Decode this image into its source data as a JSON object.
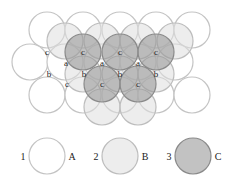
{
  "colors": {
    "A": {
      "fill": "#ffffff",
      "stroke": "#c4c4c4"
    },
    "B": {
      "fill": "#dedede",
      "fillOpacity": 0.55,
      "stroke": "#bdbdbd"
    },
    "C": {
      "fill": "#9a9a9a",
      "fillOpacity": 0.6,
      "stroke": "#8a8a8a"
    }
  },
  "radius": 18,
  "layers": {
    "A": [
      {
        "x": 47,
        "y": 30
      },
      {
        "x": 83,
        "y": 30
      },
      {
        "x": 120,
        "y": 30
      },
      {
        "x": 156,
        "y": 30
      },
      {
        "x": 192,
        "y": 30
      },
      {
        "x": 30,
        "y": 62
      },
      {
        "x": 65,
        "y": 62
      },
      {
        "x": 102,
        "y": 62
      },
      {
        "x": 138,
        "y": 62
      },
      {
        "x": 175,
        "y": 62
      },
      {
        "x": 47,
        "y": 95
      },
      {
        "x": 83,
        "y": 95
      },
      {
        "x": 120,
        "y": 95
      },
      {
        "x": 156,
        "y": 95
      },
      {
        "x": 192,
        "y": 95
      }
    ],
    "B": [
      {
        "x": 65,
        "y": 41
      },
      {
        "x": 102,
        "y": 41
      },
      {
        "x": 138,
        "y": 41
      },
      {
        "x": 175,
        "y": 41
      },
      {
        "x": 83,
        "y": 74
      },
      {
        "x": 120,
        "y": 74
      },
      {
        "x": 156,
        "y": 74
      },
      {
        "x": 102,
        "y": 107
      },
      {
        "x": 138,
        "y": 107
      }
    ],
    "C": [
      {
        "x": 83,
        "y": 52
      },
      {
        "x": 120,
        "y": 52
      },
      {
        "x": 156,
        "y": 52
      },
      {
        "x": 102,
        "y": 84
      },
      {
        "x": 138,
        "y": 84
      }
    ]
  },
  "site_labels": [
    {
      "text": "c",
      "x": 47,
      "y": 52
    },
    {
      "text": "c",
      "x": 83,
      "y": 52
    },
    {
      "text": "c",
      "x": 120,
      "y": 52
    },
    {
      "text": "c",
      "x": 156,
      "y": 52
    },
    {
      "text": "a",
      "x": 66,
      "y": 63
    },
    {
      "text": "a",
      "x": 102,
      "y": 63
    },
    {
      "text": "a",
      "x": 138,
      "y": 63
    },
    {
      "text": "b",
      "x": 49,
      "y": 74
    },
    {
      "text": "b",
      "x": 84,
      "y": 74
    },
    {
      "text": "b",
      "x": 120,
      "y": 74
    },
    {
      "text": "b",
      "x": 156,
      "y": 74
    },
    {
      "text": "c",
      "x": 67,
      "y": 84
    },
    {
      "text": "c",
      "x": 102,
      "y": 84
    },
    {
      "text": "c",
      "x": 138,
      "y": 84
    }
  ],
  "legend": [
    {
      "number": "1",
      "layer": "A",
      "letter": "A",
      "cx": 47,
      "cy": 156
    },
    {
      "number": "2",
      "layer": "B",
      "letter": "B",
      "cx": 120,
      "cy": 156
    },
    {
      "number": "3",
      "layer": "C",
      "letter": "C",
      "cx": 193,
      "cy": 156
    }
  ]
}
